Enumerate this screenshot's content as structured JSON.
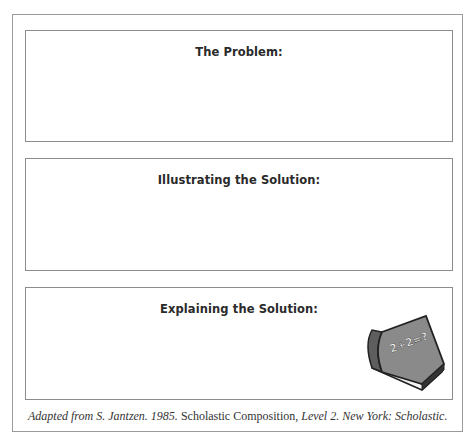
{
  "sections": [
    {
      "title": "The Problem:"
    },
    {
      "title": "Illustrating the Solution:"
    },
    {
      "title": "Explaining the Solution:"
    }
  ],
  "book": {
    "label": "2+2=?",
    "icon": "book-icon"
  },
  "caption": {
    "part1": "Adapted from S. Jantzen. 1985. ",
    "part2": "Scholastic Composition",
    "part3": ", Level 2. New York: ",
    "part4": "Scholastic."
  },
  "colors": {
    "border": "#8c8c8c",
    "book_cover": "#8a8a8a",
    "book_spine": "#5e5e5e",
    "text": "#2a2a2a"
  }
}
